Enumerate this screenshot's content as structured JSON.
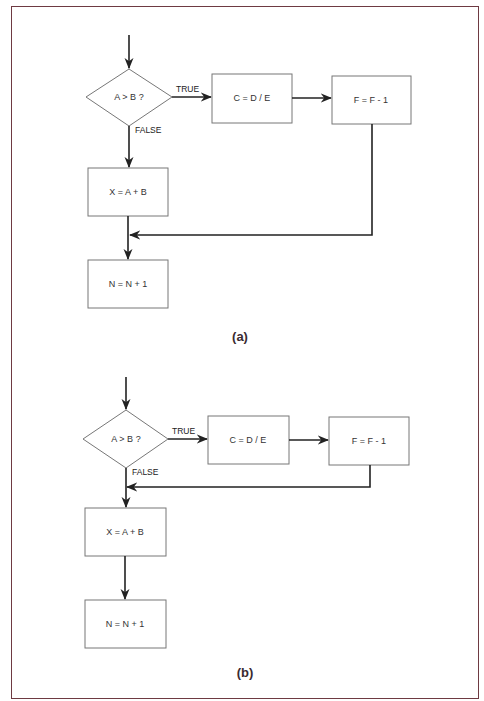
{
  "figure": {
    "border_color": "#6e3a42",
    "panels": [
      {
        "caption": "(a)",
        "decision": {
          "label": "A > B ?"
        },
        "true_label": "TRUE",
        "false_label": "FALSE",
        "nodes": {
          "c": "C = D / E",
          "f": "F = F - 1",
          "x": "X = A + B",
          "n": "N = N + 1"
        },
        "description": "TRUE branch: C = D / E then F = F - 1, then returns to join after X = A + B before N = N + 1"
      },
      {
        "caption": "(b)",
        "decision": {
          "label": "A > B ?"
        },
        "true_label": "TRUE",
        "false_label": "FALSE",
        "nodes": {
          "c": "C = D / E",
          "f": "F = F - 1",
          "x": "X = A + B",
          "n": "N = N + 1"
        },
        "description": "TRUE branch: C = D / E then F = F - 1, then returns to join before X = A + B"
      }
    ]
  }
}
